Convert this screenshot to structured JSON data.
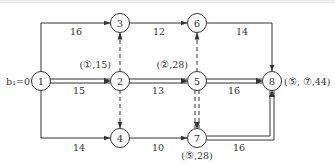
{
  "diagram": {
    "type": "network-plan",
    "start_label": "b₁=0",
    "nodes": [
      {
        "id": "1",
        "label": "1"
      },
      {
        "id": "2",
        "label": "2",
        "annotation": "(①,15)"
      },
      {
        "id": "3",
        "label": "3"
      },
      {
        "id": "4",
        "label": "4"
      },
      {
        "id": "5",
        "label": "5",
        "annotation": "(②,28)"
      },
      {
        "id": "6",
        "label": "6"
      },
      {
        "id": "7",
        "label": "7",
        "annotation": "(⑤,28)"
      },
      {
        "id": "8",
        "label": "8",
        "annotation": "(⑤, ⑦,44)"
      }
    ],
    "edges": [
      {
        "from": "1",
        "to": "3",
        "weight": "16",
        "style": "solid",
        "critical": false
      },
      {
        "from": "1",
        "to": "2",
        "weight": "15",
        "style": "solid",
        "critical": true
      },
      {
        "from": "1",
        "to": "4",
        "weight": "14",
        "style": "solid",
        "critical": false
      },
      {
        "from": "3",
        "to": "6",
        "weight": "12",
        "style": "solid",
        "critical": false
      },
      {
        "from": "2",
        "to": "3",
        "weight": "",
        "style": "dashed",
        "critical": false
      },
      {
        "from": "2",
        "to": "4",
        "weight": "",
        "style": "dashed",
        "critical": false
      },
      {
        "from": "2",
        "to": "5",
        "weight": "13",
        "style": "solid",
        "critical": true
      },
      {
        "from": "4",
        "to": "7",
        "weight": "10",
        "style": "solid",
        "critical": false
      },
      {
        "from": "5",
        "to": "6",
        "weight": "",
        "style": "dashed",
        "critical": false
      },
      {
        "from": "5",
        "to": "7",
        "weight": "",
        "style": "dashed",
        "critical": true
      },
      {
        "from": "5",
        "to": "8",
        "weight": "16",
        "style": "solid",
        "critical": true
      },
      {
        "from": "6",
        "to": "8",
        "weight": "14",
        "style": "solid",
        "critical": false
      },
      {
        "from": "7",
        "to": "8",
        "weight": "16",
        "style": "solid",
        "critical": true
      }
    ]
  }
}
